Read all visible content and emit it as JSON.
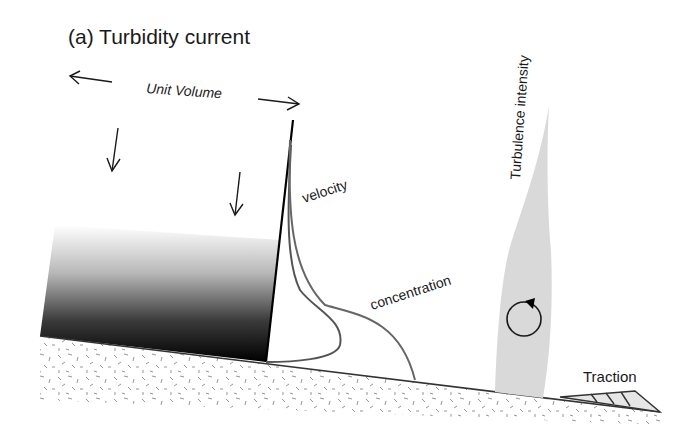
{
  "figure": {
    "title": "(a) Turbidity current",
    "labels": {
      "unit_volume": "Unit Volume",
      "velocity": "velocity",
      "concentration": "concentration",
      "turbulence": "Turbulence intensity",
      "traction": "Traction"
    },
    "colors": {
      "ink": "#1a1a1a",
      "curve": "#555555",
      "turbulence_fill": "#d9d9d9",
      "traction_fill": "#e6e6e6",
      "sediment_dash": "#8a8a8a"
    }
  }
}
